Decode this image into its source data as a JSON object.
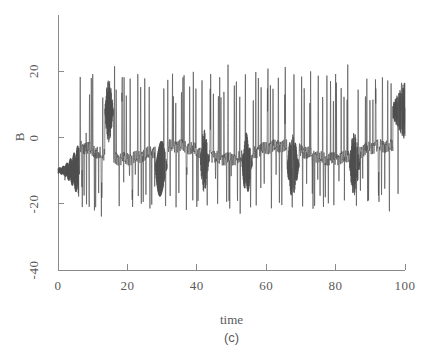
{
  "chart_data": {
    "type": "line",
    "title": "",
    "subtitle": "",
    "xlabel": "time",
    "ylabel": "B",
    "panel_label": "(c)",
    "xlim": [
      0,
      100
    ],
    "ylim": [
      -40,
      30
    ],
    "xticks": [
      0,
      20,
      40,
      60,
      80,
      100
    ],
    "xtick_labels": [
      "0",
      "20",
      "40",
      "60",
      "80",
      "100"
    ],
    "yticks": [
      20,
      0,
      -20,
      -40
    ],
    "ytick_labels": [
      "20",
      "0",
      "-20",
      "-40"
    ],
    "grid": false,
    "legend": null,
    "legend_position": "none",
    "line_color": "#4d4d4d",
    "axis_color": "#8a8a8a",
    "background_color": "#ffffff",
    "series": [
      {
        "name": "B(t)",
        "description": "Chaotic spiking / bursting time series. Starts with a small-amplitude fast oscillation about B = -10 that slowly grows (t = 0 to 6), then breaks into irregular large-amplitude spikes with peaks near +17 to +24 and troughs near -18 to -25, interspersed with decaying spindle-shaped oscillation bursts centred near B = +8.",
        "x_sample_step": 0.04,
        "envelope_peaks": [
          {
            "t": 6.4,
            "value": 19.0
          },
          {
            "t": 8.2,
            "value": 18.5
          },
          {
            "t": 9.6,
            "value": 19.5
          },
          {
            "t": 12.9,
            "value": 14.0
          },
          {
            "t": 16.3,
            "value": 23.5
          },
          {
            "t": 18.5,
            "value": 21.0
          },
          {
            "t": 20.8,
            "value": 19.5
          },
          {
            "t": 23.0,
            "value": 20.0
          },
          {
            "t": 25.0,
            "value": 19.5
          },
          {
            "t": 27.0,
            "value": 24.0
          },
          {
            "t": 30.5,
            "value": 17.5
          },
          {
            "t": 33.0,
            "value": 20.0
          },
          {
            "t": 36.0,
            "value": 20.5
          },
          {
            "t": 39.0,
            "value": 21.5
          },
          {
            "t": 41.5,
            "value": 19.0
          },
          {
            "t": 44.0,
            "value": 20.0
          },
          {
            "t": 46.6,
            "value": 21.0
          },
          {
            "t": 49.0,
            "value": 22.0
          },
          {
            "t": 51.4,
            "value": 19.5
          },
          {
            "t": 54.0,
            "value": 20.0
          },
          {
            "t": 57.0,
            "value": 22.5
          },
          {
            "t": 60.5,
            "value": 23.5
          },
          {
            "t": 63.5,
            "value": 19.5
          },
          {
            "t": 65.5,
            "value": 24.0
          },
          {
            "t": 68.0,
            "value": 20.0
          },
          {
            "t": 70.5,
            "value": 21.0
          },
          {
            "t": 72.8,
            "value": 20.0
          },
          {
            "t": 75.0,
            "value": 19.5
          },
          {
            "t": 77.5,
            "value": 20.5
          },
          {
            "t": 80.0,
            "value": 21.0
          },
          {
            "t": 83.5,
            "value": 24.0
          },
          {
            "t": 86.5,
            "value": 17.0
          },
          {
            "t": 89.0,
            "value": 18.5
          },
          {
            "t": 91.5,
            "value": 19.0
          },
          {
            "t": 93.5,
            "value": 20.5
          },
          {
            "t": 96.0,
            "value": 17.0
          },
          {
            "t": 99.0,
            "value": 17.5
          }
        ],
        "envelope_troughs": [
          {
            "t": 2.0,
            "value": -13.0
          },
          {
            "t": 7.0,
            "value": -21.0
          },
          {
            "t": 9.0,
            "value": -21.5
          },
          {
            "t": 10.5,
            "value": -22.0
          },
          {
            "t": 12.5,
            "value": -24.5
          },
          {
            "t": 19.0,
            "value": -22.0
          },
          {
            "t": 21.5,
            "value": -22.0
          },
          {
            "t": 24.0,
            "value": -21.0
          },
          {
            "t": 26.5,
            "value": -22.0
          },
          {
            "t": 31.0,
            "value": -21.5
          },
          {
            "t": 34.0,
            "value": -24.0
          },
          {
            "t": 37.0,
            "value": -22.5
          },
          {
            "t": 40.0,
            "value": -21.5
          },
          {
            "t": 43.0,
            "value": -22.0
          },
          {
            "t": 46.0,
            "value": -21.0
          },
          {
            "t": 49.5,
            "value": -22.5
          },
          {
            "t": 52.5,
            "value": -23.0
          },
          {
            "t": 55.5,
            "value": -22.0
          },
          {
            "t": 58.5,
            "value": -22.5
          },
          {
            "t": 61.5,
            "value": -22.0
          },
          {
            "t": 64.5,
            "value": -21.0
          },
          {
            "t": 67.5,
            "value": -22.5
          },
          {
            "t": 70.5,
            "value": -22.0
          },
          {
            "t": 73.5,
            "value": -21.5
          },
          {
            "t": 76.5,
            "value": -22.0
          },
          {
            "t": 79.5,
            "value": -22.0
          },
          {
            "t": 82.5,
            "value": -22.5
          },
          {
            "t": 86.0,
            "value": -21.0
          },
          {
            "t": 89.5,
            "value": -19.5
          },
          {
            "t": 92.5,
            "value": -20.0
          },
          {
            "t": 95.5,
            "value": -24.5
          },
          {
            "t": 98.0,
            "value": -17.0
          }
        ],
        "spindle_bursts": [
          {
            "t_start": 0.0,
            "t_end": 6.0,
            "center": -10.0,
            "note": "slowly growing fast oscillation"
          },
          {
            "t_start": 13.5,
            "t_end": 16.0,
            "center": 8.0,
            "note": "grow-decay spindle"
          },
          {
            "t_start": 28.0,
            "t_end": 31.5,
            "center": -9.0,
            "note": "decaying spindle"
          },
          {
            "t_start": 41.0,
            "t_end": 43.5,
            "center": -7.0,
            "note": "decaying spindle"
          },
          {
            "t_start": 53.0,
            "t_end": 56.0,
            "center": -8.0,
            "note": "decaying spindle"
          },
          {
            "t_start": 66.0,
            "t_end": 69.5,
            "center": -8.5,
            "note": "decaying spindle"
          },
          {
            "t_start": 84.0,
            "t_end": 87.0,
            "center": -8.0,
            "note": "decaying spindle"
          },
          {
            "t_start": 96.5,
            "t_end": 100.0,
            "center": 8.0,
            "note": "terminal spindle"
          }
        ]
      }
    ]
  },
  "geometry": {
    "plot_left_px": 58,
    "plot_right_px": 405,
    "plot_top_px": 15,
    "plot_bottom_px": 270,
    "y_value_at_top_px": 37,
    "y_value_at_bottom_px": -40
  }
}
